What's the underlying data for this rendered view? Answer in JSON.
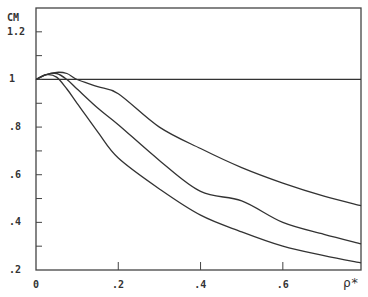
{
  "chart_data": {
    "type": "line",
    "title": "",
    "ylabel": "CM",
    "xlabel": "ρ*",
    "xlim": [
      0,
      0.79
    ],
    "ylim": [
      0.2,
      1.3
    ],
    "grid": false,
    "legend": null,
    "x_ticks": [
      {
        "value": 0,
        "label": "0"
      },
      {
        "value": 0.2,
        "label": ".2"
      },
      {
        "value": 0.4,
        "label": ".4"
      },
      {
        "value": 0.6,
        "label": ".6"
      }
    ],
    "y_ticks": [
      {
        "value": 0.2,
        "label": ".2"
      },
      {
        "value": 0.4,
        "label": ".4"
      },
      {
        "value": 0.6,
        "label": ".6"
      },
      {
        "value": 0.8,
        "label": ".8"
      },
      {
        "value": 1.0,
        "label": "1"
      },
      {
        "value": 1.2,
        "label": "1.2"
      }
    ],
    "y_minor_ticks": [
      0.3,
      0.5,
      0.7,
      0.9,
      1.1
    ],
    "reference_line": {
      "y": 1.0
    },
    "x": [
      0,
      0.025,
      0.05,
      0.075,
      0.1,
      0.15,
      0.2,
      0.3,
      0.4,
      0.5,
      0.6,
      0.7,
      0.79
    ],
    "series": [
      {
        "name": "curve-upper",
        "values": [
          1.0,
          1.02,
          1.03,
          1.025,
          1.0,
          0.97,
          0.94,
          0.8,
          0.71,
          0.63,
          0.565,
          0.51,
          0.47
        ]
      },
      {
        "name": "curve-middle",
        "values": [
          1.0,
          1.02,
          1.025,
          1.0,
          0.96,
          0.88,
          0.81,
          0.66,
          0.53,
          0.49,
          0.4,
          0.35,
          0.31
        ]
      },
      {
        "name": "curve-lower",
        "values": [
          1.0,
          1.02,
          1.01,
          0.96,
          0.9,
          0.78,
          0.67,
          0.54,
          0.43,
          0.36,
          0.3,
          0.26,
          0.23
        ]
      }
    ]
  },
  "style": {
    "line_color": "#333333",
    "axis_color": "#444444"
  }
}
